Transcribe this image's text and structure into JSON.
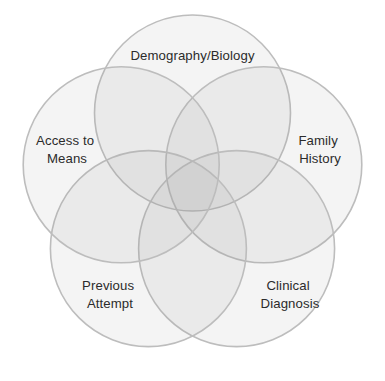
{
  "diagram": {
    "type": "venn",
    "set_count": 5,
    "background_color": "#ffffff",
    "fill_color": "#9d9d9d",
    "stroke_color": "#bdbdbd",
    "label_color": "#2b2b2b",
    "sets": [
      {
        "id": "demography-biology",
        "label": "Demography/Biology",
        "lines": [
          "Demography/Biology"
        ],
        "position": "top",
        "center_x": 192.5,
        "center_y": 113,
        "radius": 98
      },
      {
        "id": "family-history",
        "label": "Family History",
        "lines": [
          "Family",
          "History"
        ],
        "position": "right",
        "center_x": 263.8,
        "center_y": 164.8,
        "radius": 98
      },
      {
        "id": "clinical-diagnosis",
        "label": "Clinical Diagnosis",
        "lines": [
          "Clinical",
          "Diagnosis"
        ],
        "position": "bottom-right",
        "center_x": 236.6,
        "center_y": 248.6,
        "radius": 98
      },
      {
        "id": "previous-attempt",
        "label": "Previous Attempt",
        "lines": [
          "Previous",
          "Attempt"
        ],
        "position": "bottom-left",
        "center_x": 148.4,
        "center_y": 248.6,
        "radius": 98
      },
      {
        "id": "access-to-means",
        "label": "Access to Means",
        "lines": [
          "Access to",
          "Means"
        ],
        "position": "left",
        "center_x": 121.2,
        "center_y": 164.8,
        "radius": 98
      }
    ],
    "labels": {
      "demography_biology_line1": "Demography/Biology",
      "family_history_line1": "Family",
      "family_history_line2": "History",
      "clinical_diagnosis_line1": "Clinical",
      "clinical_diagnosis_line2": "Diagnosis",
      "previous_attempt_line1": "Previous",
      "previous_attempt_line2": "Attempt",
      "access_to_means_line1": "Access to",
      "access_to_means_line2": "Means"
    }
  }
}
